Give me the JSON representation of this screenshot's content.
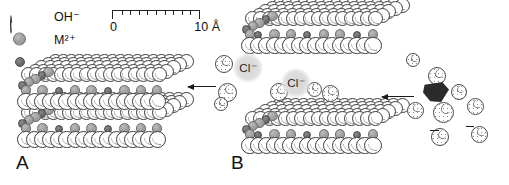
{
  "figure": {
    "panels": [
      {
        "id": "A",
        "label": "A"
      },
      {
        "id": "B",
        "label": "B"
      }
    ]
  },
  "legend": {
    "items": [
      {
        "symbol": "OH",
        "charge": "−",
        "label": "OH⁻",
        "icon": "hydroxide-sphere",
        "color": "#ffffff",
        "size": 20
      },
      {
        "symbol": "M",
        "charge": "2+",
        "label": "M²⁺",
        "icon": "divalent-cation-sphere",
        "color": "#a2a2a2",
        "size": 13
      },
      {
        "symbol": "M",
        "charge": "3+",
        "label": "M³⁺",
        "icon": "trivalent-cation-sphere",
        "color": "#6e6e6e",
        "size": 10
      }
    ]
  },
  "scale_bar": {
    "min_label": "0",
    "max_label": "10 Å",
    "units": "Å",
    "min_value": 0,
    "max_value": 10,
    "tick_count": 10
  },
  "interlayer": {
    "anion_label": "Cl⁻",
    "anions": [
      {
        "label": "Cl⁻",
        "x": 248,
        "y": 68
      },
      {
        "label": "Cl⁻",
        "x": 296,
        "y": 83
      }
    ],
    "halo_color": "#dedede",
    "water_icon": "water-molecule-sphere"
  },
  "arrows": [
    {
      "name": "exchange-arrow-left",
      "direction": "left",
      "x": 188,
      "y": 86,
      "length": 28
    },
    {
      "name": "exchange-arrow-right",
      "direction": "left",
      "x": 382,
      "y": 96,
      "length": 32
    }
  ],
  "guest": {
    "name": "intercalating-anion",
    "color": "#2b2b2b"
  },
  "colors": {
    "background": "#ffffff",
    "outline": "#3a3a3a",
    "m2_fill": "#a2a2a2",
    "m3_fill": "#6e6e6e",
    "oh_fill": "#ffffff",
    "halo": "#dedede",
    "guest": "#2b2b2b",
    "text": "#111111"
  }
}
